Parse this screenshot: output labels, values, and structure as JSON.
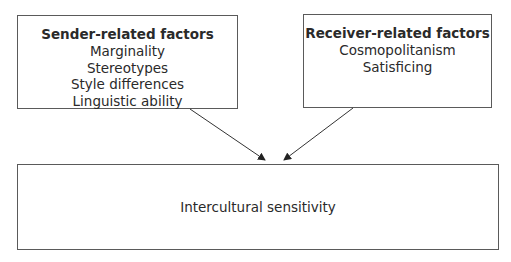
{
  "diagram": {
    "sender_box": {
      "title": "Sender-related factors",
      "items": [
        "Marginality",
        "Stereotypes",
        "Style differences",
        "Linguistic ability"
      ]
    },
    "receiver_box": {
      "title": "Receiver-related factors",
      "items": [
        "Cosmopolitanism",
        "Satisficing"
      ]
    },
    "outcome_box": {
      "label": "Intercultural sensitivity"
    },
    "edges": [
      {
        "from": "sender_box",
        "to": "outcome_box"
      },
      {
        "from": "receiver_box",
        "to": "outcome_box"
      }
    ],
    "colors": {
      "line": "#333333",
      "border": "#5a5a5a",
      "text": "#2a2a2a"
    }
  }
}
